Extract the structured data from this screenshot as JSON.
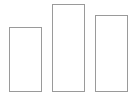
{
  "chart_data": {
    "type": "bar",
    "title": "",
    "xlabel": "",
    "ylabel": "",
    "categories": [
      "",
      "",
      ""
    ],
    "values": [
      65,
      88,
      77
    ],
    "ylim": [
      0,
      92
    ],
    "grid": false,
    "legend": null,
    "style": {
      "fill": "#ffffff",
      "stroke": "#9a9a9a"
    }
  },
  "layout": {
    "baseline_y": 92,
    "bars": [
      {
        "left": 9,
        "width": 33
      },
      {
        "left": 52,
        "width": 33
      },
      {
        "left": 95,
        "width": 33
      }
    ]
  }
}
